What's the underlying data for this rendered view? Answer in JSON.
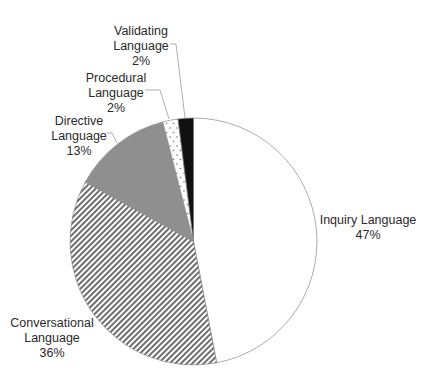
{
  "chart_data": {
    "type": "pie",
    "title": "",
    "start_angle_deg": 0,
    "direction": "clockwise",
    "slices": [
      {
        "label": "Inquiry Language",
        "value": 47,
        "pct_label": "47%",
        "fill": "white",
        "color": "#ffffff"
      },
      {
        "label": "Conversational Language",
        "value": 36,
        "pct_label": "36%",
        "fill": "diagonal-hatch",
        "color": "#7a7a7a"
      },
      {
        "label": "Directive Language",
        "value": 13,
        "pct_label": "13%",
        "fill": "solid-gray",
        "color": "#8f8f8f"
      },
      {
        "label": "Procedural Language",
        "value": 2,
        "pct_label": "2%",
        "fill": "dotted",
        "color": "#ffffff"
      },
      {
        "label": "Validating Language",
        "value": 2,
        "pct_label": "2%",
        "fill": "solid-black",
        "color": "#111111"
      }
    ],
    "legend": "none",
    "data_labels": "outside with leader lines"
  },
  "labels": {
    "inquiry": {
      "line1": "Inquiry Language",
      "line2": "47%"
    },
    "conversational": {
      "line1": "Conversational",
      "line2": "Language",
      "line3": "36%"
    },
    "directive": {
      "line1": "Directive",
      "line2": "Language",
      "line3": "13%"
    },
    "procedural": {
      "line1": "Procedural",
      "line2": "Language",
      "line3": "2%"
    },
    "validating": {
      "line1": "Validating",
      "line2": "Language",
      "line3": "2%"
    }
  }
}
